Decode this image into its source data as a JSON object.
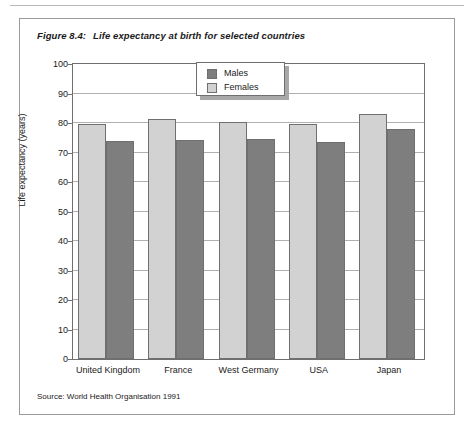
{
  "figure": {
    "number": "Figure 8.4:",
    "title": "Life expectancy at birth for selected countries",
    "source": "Source: World Health Organisation 1991"
  },
  "legend": {
    "items": [
      {
        "label": "Males",
        "color": "#7e7e7e"
      },
      {
        "label": "Females",
        "color": "#d2d2d2"
      }
    ]
  },
  "chart_data": {
    "type": "bar",
    "title": "Life expectancy at birth for selected countries",
    "subtitle": "",
    "xlabel": "",
    "ylabel": "Life expectancy (years)",
    "categories": [
      "United Kingdom",
      "France",
      "West Germany",
      "USA",
      "Japan"
    ],
    "series": [
      {
        "name": "Females",
        "color": "#d2d2d2",
        "values": [
          79.5,
          81.5,
          80.5,
          79.5,
          83.0
        ]
      },
      {
        "name": "Males",
        "color": "#7e7e7e",
        "values": [
          74.0,
          74.3,
          74.5,
          73.5,
          78.0
        ]
      }
    ],
    "ylim": [
      0,
      100
    ],
    "yticks": [
      0,
      10,
      20,
      30,
      40,
      50,
      60,
      70,
      80,
      90,
      100
    ],
    "ytick_labels": [
      "0",
      "10",
      "20",
      "30",
      "40",
      "50",
      "60",
      "70",
      "80",
      "90",
      "100"
    ],
    "grid": true,
    "legend_position": "top-center",
    "series_order": [
      "Females",
      "Males"
    ],
    "annotations": []
  }
}
